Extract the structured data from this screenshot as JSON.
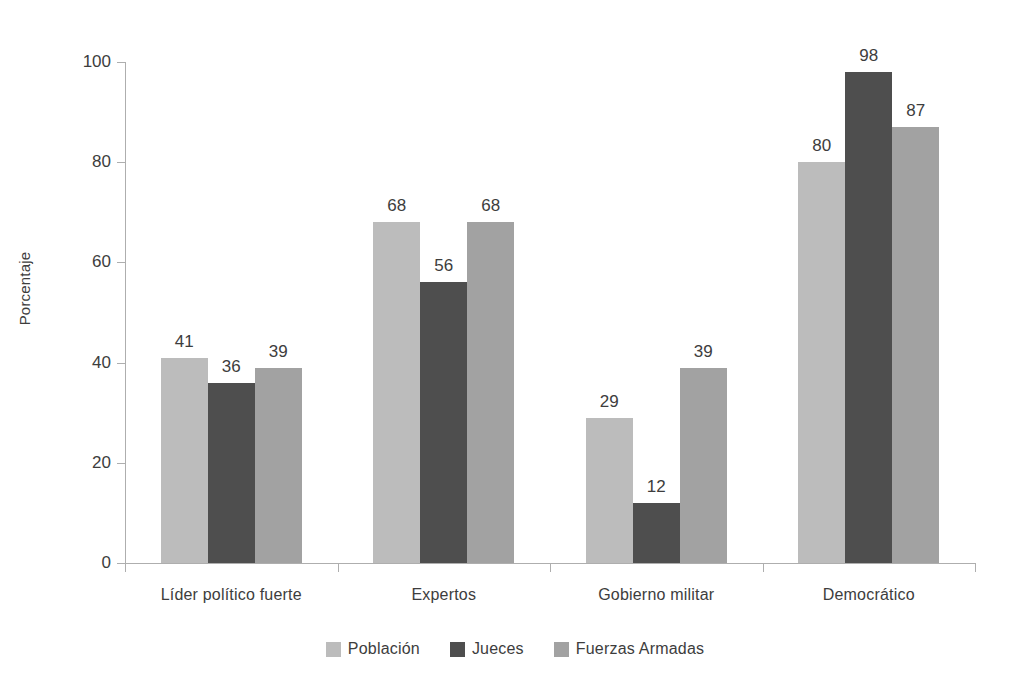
{
  "chart_data": {
    "type": "bar",
    "title": "",
    "xlabel": "",
    "ylabel": "Porcentaje",
    "ylim": [
      0,
      100
    ],
    "yticks": [
      0,
      20,
      40,
      60,
      80,
      100
    ],
    "ytick_labels": [
      "0",
      "20",
      "40",
      "60",
      "80",
      "100"
    ],
    "grid": false,
    "legend_position": "bottom",
    "categories": [
      "Líder político fuerte",
      "Expertos",
      "Gobierno militar",
      "Democrático"
    ],
    "series": [
      {
        "name": "Población",
        "color": "#bcbcbc",
        "values": [
          41,
          68,
          29,
          80
        ],
        "labels": [
          "41",
          "68",
          "29",
          "80"
        ]
      },
      {
        "name": "Jueces",
        "color": "#4e4e4e",
        "values": [
          36,
          56,
          12,
          98
        ],
        "labels": [
          "36",
          "56",
          "12",
          "98"
        ]
      },
      {
        "name": "Fuerzas Armadas",
        "color": "#a2a2a2",
        "values": [
          39,
          68,
          39,
          87
        ],
        "labels": [
          "39",
          "68",
          "39",
          "87"
        ]
      }
    ]
  },
  "axis": {
    "y_title": "Porcentaje"
  },
  "legend": {
    "items": [
      {
        "label": "Población",
        "color": "#bcbcbc"
      },
      {
        "label": "Jueces",
        "color": "#4e4e4e"
      },
      {
        "label": "Fuerzas Armadas",
        "color": "#a2a2a2"
      }
    ]
  }
}
